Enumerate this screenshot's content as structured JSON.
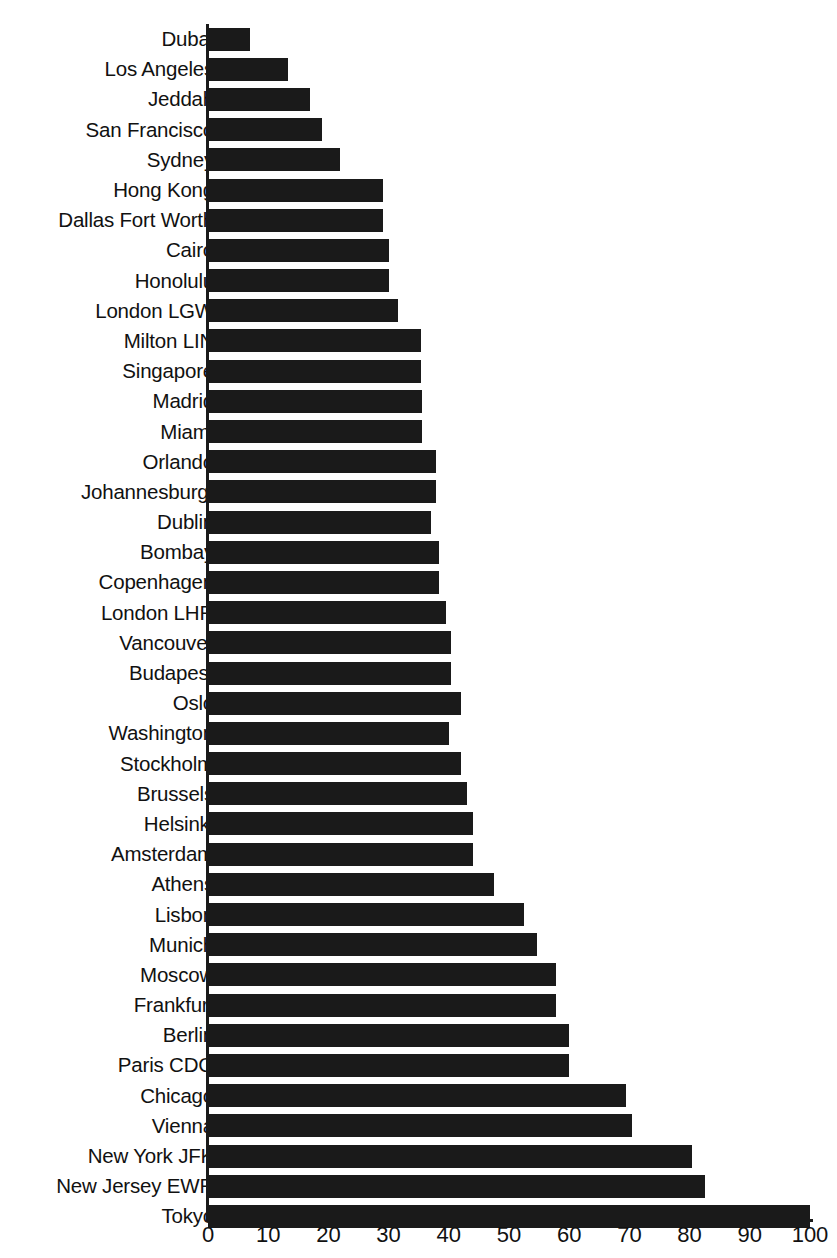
{
  "chart_data": {
    "type": "bar",
    "orientation": "horizontal",
    "title": "",
    "subtitle": "",
    "xlabel": "",
    "ylabel": "",
    "xlim": [
      0,
      100
    ],
    "ylim": null,
    "grid": false,
    "legend": null,
    "legend_position": "none",
    "bar_color": "#1a1a1a",
    "axis_color": "#1a1a1a",
    "background_color": "#ffffff",
    "xticks": [
      0,
      10,
      20,
      30,
      40,
      50,
      60,
      70,
      80,
      90,
      100
    ],
    "xtick_labels": [
      "0",
      "10",
      "20",
      "30",
      "40",
      "50",
      "60",
      "70",
      "80",
      "90",
      "100"
    ],
    "categories": [
      "Dubai",
      "Los Angeles",
      "Jeddah",
      "San Francisco",
      "Sydney",
      "Hong Kong",
      "Dallas Fort Worth",
      "Cairo",
      "Honolulu",
      "London LGW",
      "Milton LIN",
      "Singapore",
      "Madrid",
      "Miami",
      "Orlando",
      "Johannesburg.",
      "Dublin",
      "Bombay",
      "Copenhagen",
      "London LHR",
      "Vancouver",
      "Budapest",
      "Oslo",
      "Washington",
      "Stockholm",
      "Brussels",
      "Helsinki",
      "Amsterdam",
      "Athens",
      "Lisbon",
      "Munich",
      "Moscow",
      "Frankfurt",
      "Berlin",
      "Paris CDG",
      "Chicago",
      "Vienna",
      "New York JFK",
      "New Jersey EWR",
      "Tokyo"
    ],
    "values": [
      7,
      13.3,
      17,
      19,
      22,
      29,
      29,
      30,
      30,
      31.5,
      35.4,
      35.4,
      35.5,
      35.5,
      37.9,
      37.9,
      37,
      38.4,
      38.4,
      39.5,
      40.4,
      40.4,
      42,
      40,
      42,
      43,
      44,
      44,
      47.5,
      52.5,
      54.7,
      57.8,
      57.8,
      60,
      60,
      69.4,
      70.4,
      80.4,
      82.6,
      100
    ]
  }
}
